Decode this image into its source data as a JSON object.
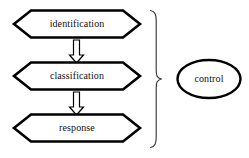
{
  "diagram": {
    "type": "flowchart",
    "background_color": "#ffffff",
    "stroke_color": "#000000",
    "text_color": "#111111",
    "nodes": [
      {
        "id": "identification",
        "label": "identification",
        "shape": "hexagon"
      },
      {
        "id": "classification",
        "label": "classification",
        "shape": "hexagon"
      },
      {
        "id": "response",
        "label": "response",
        "shape": "hexagon"
      },
      {
        "id": "control",
        "label": "control",
        "shape": "ellipse"
      }
    ],
    "connectors": [
      {
        "id": "arrow-identification-classification",
        "shape": "block-arrow",
        "direction": "down"
      },
      {
        "id": "arrow-classification-response",
        "shape": "block-arrow",
        "direction": "down"
      }
    ],
    "grouping": {
      "id": "brace-group",
      "shape": "curly-brace",
      "orientation": "right-pointing",
      "members": [
        "identification",
        "classification",
        "response"
      ],
      "points_to": "control"
    }
  }
}
